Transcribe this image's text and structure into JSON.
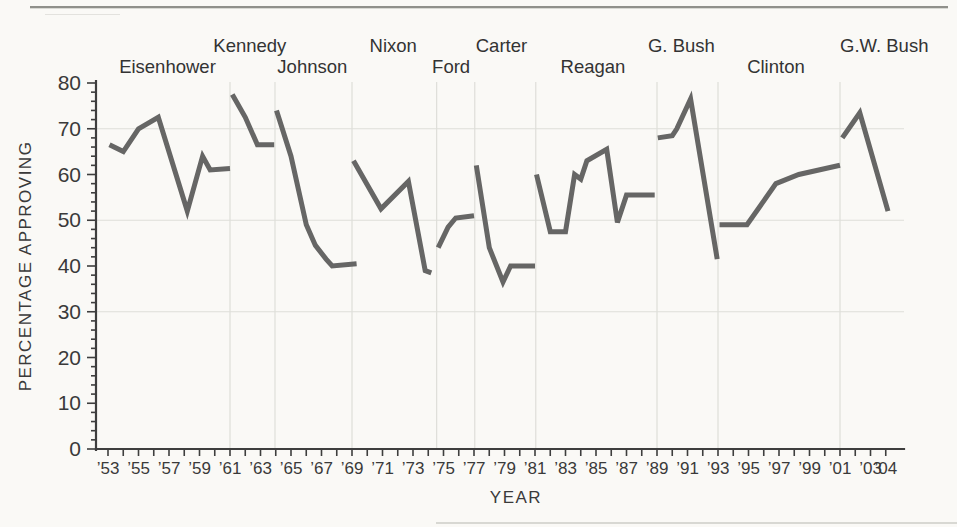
{
  "chart_data": {
    "type": "line",
    "title": "",
    "xlabel": "YEAR",
    "ylabel": "PERCENTAGE APPROVING",
    "ylim": [
      0,
      80
    ],
    "xlim": [
      1953,
      2004
    ],
    "legend": "none",
    "grid": {
      "horizontal_lines_at": [
        30,
        50,
        70
      ],
      "presidency_divider_years": [
        1961,
        1963.95,
        1969,
        1974.55,
        1977.05,
        1981.05,
        1989,
        1993,
        2001
      ]
    },
    "colors": {
      "line": "#666665",
      "axis": "#3e3e3e",
      "grid": "#deded9",
      "text": "#3a3a3a",
      "background": "#faf9f6"
    },
    "y_axis": {
      "major_tick_step": 10,
      "minor_tick_step": 2,
      "tick_labels": [
        "0",
        "10",
        "20",
        "30",
        "40",
        "50",
        "60",
        "70",
        "80"
      ]
    },
    "x_axis": {
      "minor_tick_every_year": true,
      "first_year": 1953,
      "last_year": 2004,
      "ticks": [
        {
          "year": 1953,
          "label": "’53"
        },
        {
          "year": 1955,
          "label": "’55"
        },
        {
          "year": 1957,
          "label": "’57"
        },
        {
          "year": 1959,
          "label": "’59"
        },
        {
          "year": 1961,
          "label": "’61"
        },
        {
          "year": 1963,
          "label": "’63"
        },
        {
          "year": 1965,
          "label": "’65"
        },
        {
          "year": 1967,
          "label": "’67"
        },
        {
          "year": 1969,
          "label": "’69"
        },
        {
          "year": 1971,
          "label": "’71"
        },
        {
          "year": 1973,
          "label": "’73"
        },
        {
          "year": 1975,
          "label": "’75"
        },
        {
          "year": 1977,
          "label": "’77"
        },
        {
          "year": 1979,
          "label": "’79"
        },
        {
          "year": 1981,
          "label": "’81"
        },
        {
          "year": 1983,
          "label": "’83"
        },
        {
          "year": 1985,
          "label": "’85"
        },
        {
          "year": 1987,
          "label": "’87"
        },
        {
          "year": 1989,
          "label": "’89"
        },
        {
          "year": 1991,
          "label": "’91"
        },
        {
          "year": 1993,
          "label": "’93"
        },
        {
          "year": 1995,
          "label": "’95"
        },
        {
          "year": 1997,
          "label": "’97"
        },
        {
          "year": 1999,
          "label": "’99"
        },
        {
          "year": 2001,
          "label": "’01"
        },
        {
          "year": 2003,
          "label": "’03"
        },
        {
          "year": 2004,
          "label": "’04"
        }
      ]
    },
    "series": [
      {
        "name": "Eisenhower",
        "label_row": "lower",
        "label_year": 1956.9,
        "points": [
          [
            1953.1,
            66.5
          ],
          [
            1954,
            65
          ],
          [
            1955,
            70
          ],
          [
            1956.3,
            72.5
          ],
          [
            1958.2,
            52
          ],
          [
            1959.2,
            64
          ],
          [
            1959.7,
            61
          ],
          [
            1961,
            61.3
          ]
        ]
      },
      {
        "name": "Kennedy",
        "label_row": "upper",
        "label_year": 1962.3,
        "points": [
          [
            1961.15,
            77.5
          ],
          [
            1962,
            72.5
          ],
          [
            1962.8,
            66.5
          ],
          [
            1963.9,
            66.5
          ]
        ]
      },
      {
        "name": "Johnson",
        "label_row": "lower",
        "label_year": 1966.4,
        "points": [
          [
            1964.05,
            74
          ],
          [
            1965,
            64
          ],
          [
            1966,
            49
          ],
          [
            1966.6,
            44.5
          ],
          [
            1967.3,
            41.5
          ],
          [
            1967.7,
            40
          ],
          [
            1969.3,
            40.5
          ]
        ]
      },
      {
        "name": "Nixon",
        "label_row": "upper",
        "label_year": 1971.7,
        "points": [
          [
            1969.1,
            63
          ],
          [
            1970.9,
            52.5
          ],
          [
            1972.7,
            58.5
          ],
          [
            1973.8,
            39
          ],
          [
            1974.2,
            38.5
          ]
        ]
      },
      {
        "name": "Ford",
        "label_row": "lower",
        "label_year": 1975.5,
        "points": [
          [
            1974.65,
            44
          ],
          [
            1975.3,
            48.5
          ],
          [
            1975.8,
            50.5
          ],
          [
            1977,
            51
          ]
        ]
      },
      {
        "name": "Carter",
        "label_row": "upper",
        "label_year": 1978.8,
        "points": [
          [
            1977.15,
            62
          ],
          [
            1978,
            44
          ],
          [
            1978.9,
            36.5
          ],
          [
            1979.4,
            40
          ],
          [
            1981,
            40
          ]
        ]
      },
      {
        "name": "Reagan",
        "label_row": "lower",
        "label_year": 1984.8,
        "points": [
          [
            1981.1,
            60
          ],
          [
            1982,
            47.5
          ],
          [
            1983,
            47.5
          ],
          [
            1983.6,
            60
          ],
          [
            1984,
            59
          ],
          [
            1984.4,
            63
          ],
          [
            1985.7,
            65.5
          ],
          [
            1986.4,
            49.5
          ],
          [
            1987,
            55.5
          ],
          [
            1988.85,
            55.5
          ]
        ]
      },
      {
        "name": "G. Bush",
        "label_row": "upper",
        "label_year": 1990.6,
        "points": [
          [
            1989.05,
            68
          ],
          [
            1990,
            68.5
          ],
          [
            1990.3,
            70
          ],
          [
            1991.2,
            76.5
          ],
          [
            1992.95,
            41.5
          ]
        ]
      },
      {
        "name": "Clinton",
        "label_row": "lower",
        "label_year": 1996.8,
        "points": [
          [
            1993.1,
            49
          ],
          [
            1994.9,
            49
          ],
          [
            1996.8,
            58
          ],
          [
            1998.3,
            60
          ],
          [
            2001,
            62
          ]
        ]
      },
      {
        "name": "G.W. Bush",
        "label_row": "upper",
        "label_year": 2003.9,
        "points": [
          [
            2001.15,
            68
          ],
          [
            2002.3,
            73.5
          ],
          [
            2004.15,
            52
          ]
        ]
      }
    ]
  }
}
